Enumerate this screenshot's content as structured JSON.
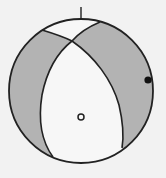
{
  "diagram": {
    "type": "focal-mechanism-beachball",
    "colors": {
      "background": "#f2f2f2",
      "compressional_fill": "#b3b3b3",
      "dilatational_fill": "#f7f7f7",
      "stroke": "#222222"
    },
    "north_tick": {
      "label": ""
    },
    "axes": [
      {
        "name": "filled-axis-marker",
        "style": "filled"
      },
      {
        "name": "open-axis-marker",
        "style": "open"
      }
    ]
  }
}
